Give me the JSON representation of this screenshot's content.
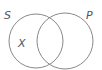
{
  "diagram": {
    "type": "venn",
    "top_text": "",
    "sets": [
      {
        "label": "S",
        "cx": 36,
        "cy": 41,
        "r": 27
      },
      {
        "label": "P",
        "cx": 65,
        "cy": 41,
        "r": 28
      }
    ],
    "region_labels": [
      {
        "label": "X",
        "region": "S only"
      }
    ],
    "colors": {
      "stroke": "#888888",
      "text": "#555555"
    }
  }
}
